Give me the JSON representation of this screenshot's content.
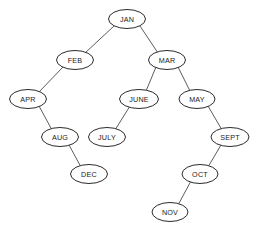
{
  "diagram": {
    "type": "binary-tree",
    "background_color": "#ffffff",
    "node_fill": "#ffffff",
    "node_stroke": "#2b2b2b",
    "edge_color": "#4a4a4a",
    "label_color": "#1a1a1a",
    "canvas": {
      "width": 259,
      "height": 232
    },
    "nodes": [
      {
        "id": "jan",
        "label": "JAN",
        "cx": 127,
        "cy": 19,
        "rx": 18.5,
        "ry": 9.5
      },
      {
        "id": "feb",
        "label": "FEB",
        "cx": 75,
        "cy": 60,
        "rx": 18.5,
        "ry": 9.5
      },
      {
        "id": "mar",
        "label": "MAR",
        "cx": 167,
        "cy": 60,
        "rx": 18.5,
        "ry": 9.5
      },
      {
        "id": "apr",
        "label": "APR",
        "cx": 28,
        "cy": 99,
        "rx": 18.5,
        "ry": 9.5
      },
      {
        "id": "june",
        "label": "JUNE",
        "cx": 139,
        "cy": 99,
        "rx": 19.5,
        "ry": 9.5
      },
      {
        "id": "may",
        "label": "MAY",
        "cx": 197,
        "cy": 99,
        "rx": 18.0,
        "ry": 9.5
      },
      {
        "id": "aug",
        "label": "AUG",
        "cx": 60,
        "cy": 137,
        "rx": 18.5,
        "ry": 9.5
      },
      {
        "id": "july",
        "label": "JULY",
        "cx": 107,
        "cy": 137,
        "rx": 18.5,
        "ry": 9.5
      },
      {
        "id": "sept",
        "label": "SEPT",
        "cx": 230,
        "cy": 137,
        "rx": 19.0,
        "ry": 9.5
      },
      {
        "id": "dec",
        "label": "DEC",
        "cx": 89,
        "cy": 174,
        "rx": 18.5,
        "ry": 9.5
      },
      {
        "id": "oct",
        "label": "OCT",
        "cx": 200,
        "cy": 174,
        "rx": 18.0,
        "ry": 9.5
      },
      {
        "id": "nov",
        "label": "NOV",
        "cx": 170,
        "cy": 212,
        "rx": 18.0,
        "ry": 9.5
      }
    ],
    "edges": [
      {
        "id": "jan-feb",
        "from": "jan",
        "to": "feb",
        "side": "left",
        "x1": 114,
        "y1": 26,
        "x2": 85,
        "y2": 53
      },
      {
        "id": "jan-mar",
        "from": "jan",
        "to": "mar",
        "side": "right",
        "x1": 140,
        "y1": 26,
        "x2": 158,
        "y2": 53
      },
      {
        "id": "feb-apr",
        "from": "feb",
        "to": "apr",
        "side": "left",
        "x1": 63,
        "y1": 67,
        "x2": 39,
        "y2": 92
      },
      {
        "id": "mar-june",
        "from": "mar",
        "to": "june",
        "side": "left",
        "x1": 156,
        "y1": 67,
        "x2": 146,
        "y2": 91
      },
      {
        "id": "mar-may",
        "from": "mar",
        "to": "may",
        "side": "right",
        "x1": 178,
        "y1": 67,
        "x2": 190,
        "y2": 91
      },
      {
        "id": "apr-aug",
        "from": "apr",
        "to": "aug",
        "side": "right",
        "x1": 39,
        "y1": 106,
        "x2": 52,
        "y2": 130
      },
      {
        "id": "june-july",
        "from": "june",
        "to": "july",
        "side": "left",
        "x1": 130,
        "y1": 106,
        "x2": 115,
        "y2": 130
      },
      {
        "id": "may-sept",
        "from": "may",
        "to": "sept",
        "side": "right",
        "x1": 208,
        "y1": 106,
        "x2": 222,
        "y2": 130
      },
      {
        "id": "aug-dec",
        "from": "aug",
        "to": "dec",
        "side": "right",
        "x1": 69,
        "y1": 145,
        "x2": 81,
        "y2": 167
      },
      {
        "id": "sept-oct",
        "from": "sept",
        "to": "oct",
        "side": "left",
        "x1": 221,
        "y1": 145,
        "x2": 208,
        "y2": 167
      },
      {
        "id": "oct-nov",
        "from": "oct",
        "to": "nov",
        "side": "left",
        "x1": 191,
        "y1": 181,
        "x2": 178,
        "y2": 205
      }
    ]
  }
}
